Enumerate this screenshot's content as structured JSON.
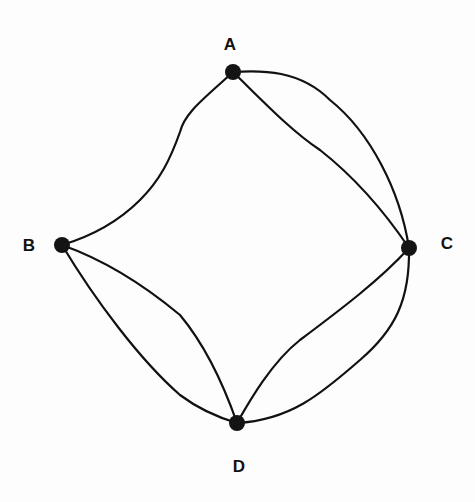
{
  "graph": {
    "title": "",
    "nodes": [
      {
        "id": "A",
        "label": "A",
        "x": 233,
        "y": 72,
        "label_x": 230,
        "label_y": 50
      },
      {
        "id": "B",
        "label": "B",
        "x": 62,
        "y": 245,
        "label_x": 29,
        "label_y": 251
      },
      {
        "id": "C",
        "label": "C",
        "x": 409,
        "y": 248,
        "label_x": 447,
        "label_y": 249
      },
      {
        "id": "D",
        "label": "D",
        "x": 237,
        "y": 423,
        "label_x": 239,
        "label_y": 472
      }
    ],
    "edges": [
      {
        "id": "A-B",
        "from": "A",
        "to": "B",
        "path": "M233,72 C205,98 185,112 180,132 C170,160 160,180 140,200 C118,222 92,236 62,245"
      },
      {
        "id": "A-C-inner",
        "from": "A",
        "to": "C",
        "path": "M233,72 C262,100 290,130 320,150 C348,172 380,205 409,248"
      },
      {
        "id": "A-C-outer",
        "from": "A",
        "to": "C",
        "path": "M233,72 C262,70 300,70 330,100 C370,132 400,190 409,248"
      },
      {
        "id": "B-D-upper",
        "from": "B",
        "to": "D",
        "path": "M62,245 C110,262 150,290 180,315 C205,345 222,380 237,423"
      },
      {
        "id": "B-D-lower",
        "from": "B",
        "to": "D",
        "path": "M62,245 C95,300 140,360 180,395 C200,410 220,418 237,423"
      },
      {
        "id": "C-D-inner",
        "from": "C",
        "to": "D",
        "path": "M409,248 C380,280 340,310 300,340 C272,362 250,400 237,423"
      },
      {
        "id": "C-D-outer",
        "from": "C",
        "to": "D",
        "path": "M409,248 C410,300 395,330 360,360 C320,395 290,420 237,423"
      }
    ],
    "colors": {
      "edge": "#111111",
      "node": "#141414",
      "label": "#111111",
      "background": "#fdfdfd"
    }
  }
}
